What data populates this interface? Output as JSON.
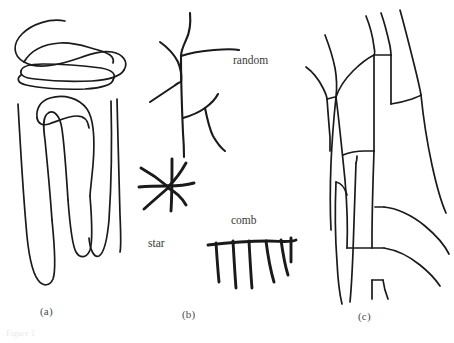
{
  "figure": {
    "width": 454,
    "height": 343,
    "background_color": "#ffffff",
    "ink_color": "#1a1a1a",
    "label_color": "#4a4a4a",
    "panels": [
      {
        "id": "a",
        "label": "(a)",
        "label_x": 40,
        "label_y": 305,
        "description": "serpentine folded curves"
      },
      {
        "id": "b",
        "label": "(b)",
        "label_x": 182,
        "label_y": 308,
        "description": "random network, star and comb motifs"
      },
      {
        "id": "c",
        "label": "(c)",
        "label_x": 358,
        "label_y": 310,
        "description": "polygonal vein network"
      }
    ],
    "inline_labels": [
      {
        "id": "random",
        "text": "random",
        "x": 233,
        "y": 54
      },
      {
        "id": "star",
        "text": "star",
        "x": 148,
        "y": 237
      },
      {
        "id": "comb",
        "text": "comb",
        "x": 231,
        "y": 214
      }
    ],
    "caption_ghost": "Figure 1"
  }
}
